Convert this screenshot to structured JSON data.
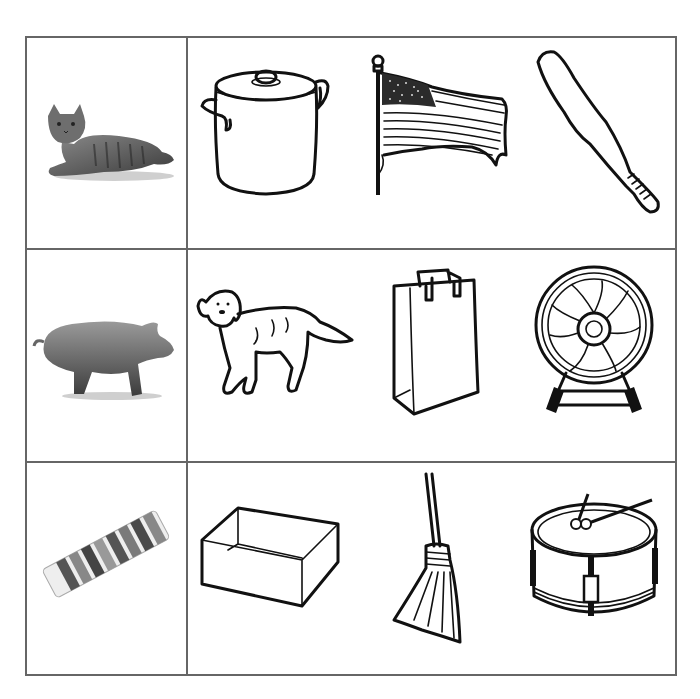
{
  "worksheet": {
    "type": "picture-matching grid",
    "grid_color": "#666666",
    "rows": [
      {
        "target": {
          "name": "cat",
          "style": "photo"
        },
        "choices": [
          {
            "name": "pot",
            "style": "line-drawing"
          },
          {
            "name": "flag",
            "style": "line-drawing"
          },
          {
            "name": "bat",
            "style": "line-drawing"
          }
        ]
      },
      {
        "target": {
          "name": "pig",
          "style": "photo"
        },
        "choices": [
          {
            "name": "dog",
            "style": "line-drawing"
          },
          {
            "name": "bag",
            "style": "line-drawing"
          },
          {
            "name": "fan",
            "style": "line-drawing"
          }
        ]
      },
      {
        "target": {
          "name": "gum",
          "style": "photo"
        },
        "choices": [
          {
            "name": "box",
            "style": "line-drawing"
          },
          {
            "name": "broom",
            "style": "line-drawing"
          },
          {
            "name": "drum",
            "style": "line-drawing"
          }
        ]
      }
    ]
  }
}
